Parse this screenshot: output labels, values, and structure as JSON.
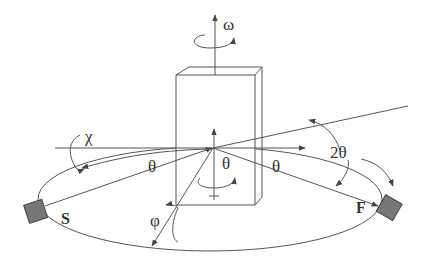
{
  "diagram": {
    "type": "four-circle diffractometer geometry",
    "colors": {
      "line": "#555555",
      "detector_fill": "#777777",
      "background": "#ffffff"
    },
    "labels": {
      "omega": "ω",
      "chi": "χ",
      "phi": "φ",
      "theta_left": "θ",
      "theta_center": "θ",
      "theta_right": "θ",
      "two_theta": "2θ",
      "source": "S",
      "focus": "F"
    },
    "components": [
      {
        "name": "sample-block",
        "shape": "rectangular prism"
      },
      {
        "name": "source-detector",
        "label": "S"
      },
      {
        "name": "focus-detector",
        "label": "F"
      },
      {
        "name": "goniometer-circle",
        "shape": "ellipse"
      }
    ],
    "axes": [
      "omega (vertical)",
      "chi (horizontal)",
      "phi (diagonal)",
      "2theta"
    ]
  }
}
